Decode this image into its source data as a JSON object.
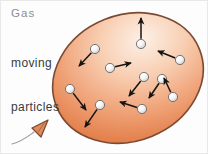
{
  "figure": {
    "canvas": {
      "width": 208,
      "height": 154
    },
    "background_color": "#fdfdfd",
    "border_color": "#e9e9e9"
  },
  "labels": {
    "gas": "Gas",
    "moving_particles_line1": "moving",
    "moving_particles_line2": "particles",
    "gas_color": "#8d8d8d",
    "particles_color": "#3a3a3a"
  },
  "balloon": {
    "name": "balloon",
    "center_x": 127,
    "center_y": 77,
    "radius_x": 77,
    "radius_y": 63,
    "rotation_deg": -22,
    "outline_color": "#7a4a33",
    "outline_width": 1.6,
    "fill_light": "#fdece1",
    "fill_mid": "#f4ad84",
    "fill_dark": "#e2763f",
    "knot": {
      "name": "balloon-knot",
      "x": 37,
      "y": 127,
      "fill": "#e08b5e",
      "outline": "#7a4a33"
    },
    "string": {
      "name": "balloon-string",
      "color": "#9a9a9a",
      "path": "M 33 131 C 26 136, 20 140, 12 143"
    }
  },
  "particle_style": {
    "radius": 4.6,
    "fill_light": "#ffffff",
    "fill_shade": "#cfcfcf",
    "outline_color": "#6a6a6a",
    "arrow_color": "#141414",
    "arrow_width": 1.5
  },
  "particles": [
    {
      "id": 1,
      "name": "particle-upper-left",
      "x": 94,
      "y": 48,
      "arrow_dx": -16,
      "arrow_dy": 17
    },
    {
      "id": 2,
      "name": "particle-top-center",
      "x": 140,
      "y": 43,
      "arrow_dx": 0,
      "arrow_dy": -26
    },
    {
      "id": 3,
      "name": "particle-center-left",
      "x": 109,
      "y": 67,
      "arrow_dx": 21,
      "arrow_dy": -5
    },
    {
      "id": 4,
      "name": "particle-right-upper",
      "x": 179,
      "y": 59,
      "arrow_dx": -22,
      "arrow_dy": -9
    },
    {
      "id": 5,
      "name": "particle-center-right",
      "x": 143,
      "y": 76,
      "arrow_dx": -15,
      "arrow_dy": 19
    },
    {
      "id": 6,
      "name": "particle-right-mid",
      "x": 161,
      "y": 78,
      "arrow_dx": -13,
      "arrow_dy": 19
    },
    {
      "id": 7,
      "name": "particle-left-lower",
      "x": 69,
      "y": 88,
      "arrow_dx": 16,
      "arrow_dy": 21
    },
    {
      "id": 8,
      "name": "particle-bottom-center",
      "x": 99,
      "y": 104,
      "arrow_dx": -15,
      "arrow_dy": 22
    },
    {
      "id": 9,
      "name": "particle-bottom-right",
      "x": 141,
      "y": 108,
      "arrow_dx": -22,
      "arrow_dy": -7
    },
    {
      "id": 10,
      "name": "particle-lower-right-edge",
      "x": 172,
      "y": 96,
      "arrow_dx": -9,
      "arrow_dy": -19
    }
  ]
}
